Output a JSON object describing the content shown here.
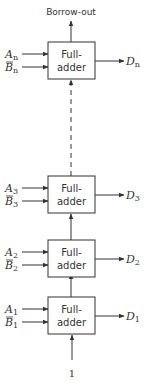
{
  "diagram": {
    "top_output_label": "Borrow-out",
    "carry_in_label": "1",
    "block_label_line1": "Full-",
    "block_label_line2": "adder",
    "stages": [
      {
        "id": "n",
        "a": "A",
        "b": "B",
        "d": "D",
        "sub": "n",
        "b_complemented": true
      },
      {
        "id": "3",
        "a": "A",
        "b": "B",
        "d": "D",
        "sub": "3",
        "b_complemented": true
      },
      {
        "id": "2",
        "a": "A",
        "b": "B",
        "d": "D",
        "sub": "2",
        "b_complemented": true
      },
      {
        "id": "1",
        "a": "A",
        "b": "B",
        "d": "D",
        "sub": "1",
        "b_complemented": true
      }
    ],
    "gap_between_stage_n_and_3": "dashed"
  }
}
